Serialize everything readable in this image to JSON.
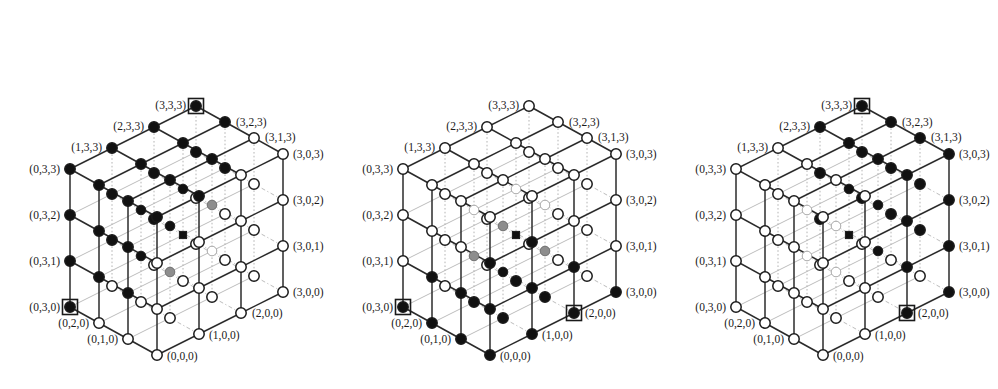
{
  "figure": {
    "kind": "three 4x4x4 cubic lattice diagrams",
    "panel_count": 3,
    "grid_size": 4,
    "axis_values": [
      0,
      1,
      2,
      3
    ]
  },
  "legend": {
    "filled_node": "black filled circle",
    "empty_node": "white open circle",
    "shaded_node": "gray filled circle",
    "boxed_node": "node enclosed in a square frame",
    "square_node": "small black filled square"
  },
  "colors": {
    "node_fill_black": "#111111",
    "node_fill_gray": "#8a8a8a",
    "node_fill_white": "#ffffff",
    "node_stroke": "#1a1a1a",
    "edge_front": "#2b2b2b",
    "edge_back": "#bdbdbd",
    "edge_dotted": "#b4b4b4",
    "label_text": "#1a1a1a",
    "background": "#ffffff"
  },
  "geometry": {
    "origin": [
      157,
      355
    ],
    "step_x": [
      42,
      -21
    ],
    "step_y": [
      -29,
      -16
    ],
    "step_z": [
      0,
      -46
    ],
    "panel_offsets": [
      0,
      333,
      666
    ],
    "node_radius": 5.2,
    "box_size": 15
  },
  "labels": {
    "left_face": [
      "(0,3,3)",
      "(0,3,2)",
      "(0,3,1)",
      "(0,3,0)"
    ],
    "right_face": [
      "(3,0,3)",
      "(3,0,2)",
      "(3,0,1)",
      "(3,0,0)"
    ],
    "top_left_ridge": [
      "(3,3,3)",
      "(2,3,3)",
      "(1,3,3)",
      "(0,3,3)"
    ],
    "top_right_ridge": [
      "(3,3,3)",
      "(3,2,3)",
      "(3,1,3)",
      "(3,0,3)"
    ],
    "bottom_left_ridge": [
      "(0,3,0)",
      "(0,2,0)",
      "(0,1,0)",
      "(0,0,0)"
    ],
    "bottom_right_ridge": [
      "(0,0,0)",
      "(1,0,0)",
      "(2,0,0)",
      "(3,0,0)"
    ],
    "all": [
      "(3,3,3)",
      "(2,3,3)",
      "(1,3,3)",
      "(0,3,3)",
      "(3,2,3)",
      "(3,1,3)",
      "(3,0,3)",
      "(3,0,2)",
      "(3,0,1)",
      "(3,0,0)",
      "(2,0,0)",
      "(1,0,0)",
      "(0,0,0)",
      "(0,1,0)",
      "(0,2,0)",
      "(0,3,0)",
      "(0,3,1)",
      "(0,3,2)"
    ]
  },
  "panels": [
    {
      "name": "panel-left",
      "boxed_nodes": [
        [
          3,
          3,
          3
        ],
        [
          0,
          3,
          0
        ]
      ],
      "square_nodes": [
        [
          2,
          2,
          1
        ]
      ],
      "description": "upper-rear region filled black, lower-front region open"
    },
    {
      "name": "panel-middle",
      "boxed_nodes": [
        [
          0,
          3,
          0
        ],
        [
          2,
          0,
          0
        ]
      ],
      "square_nodes": [
        [
          2,
          2,
          1
        ]
      ],
      "description": "lower-front region filled black, upper-rear region open"
    },
    {
      "name": "panel-right",
      "boxed_nodes": [
        [
          3,
          3,
          3
        ],
        [
          2,
          0,
          0
        ]
      ],
      "square_nodes": [
        [
          2,
          2,
          1
        ]
      ],
      "description": "diagonal half-space filled black toward the +x / +z side"
    }
  ],
  "node_states": {
    "panel_left": {
      "black": [
        [
          3,
          3,
          3
        ],
        [
          2,
          3,
          3
        ],
        [
          1,
          3,
          3
        ],
        [
          0,
          3,
          3
        ],
        [
          3,
          2,
          3
        ],
        [
          0,
          3,
          2
        ],
        [
          0,
          3,
          1
        ],
        [
          0,
          3,
          0
        ],
        [
          1,
          3,
          2
        ],
        [
          2,
          3,
          2
        ],
        [
          3,
          3,
          2
        ],
        [
          1,
          3,
          1
        ],
        [
          2,
          3,
          1
        ],
        [
          0,
          2,
          3
        ],
        [
          1,
          2,
          3
        ],
        [
          2,
          2,
          3
        ],
        [
          3,
          2,
          2
        ],
        [
          0,
          2,
          2
        ],
        [
          1,
          2,
          2
        ],
        [
          2,
          2,
          2
        ],
        [
          0,
          2,
          1
        ],
        [
          1,
          2,
          1
        ],
        [
          0,
          1,
          3
        ],
        [
          1,
          1,
          3
        ],
        [
          2,
          1,
          3
        ],
        [
          0,
          1,
          2
        ],
        [
          1,
          1,
          2
        ],
        [
          0,
          0,
          3
        ],
        [
          1,
          0,
          3
        ],
        [
          0,
          1,
          1
        ]
      ],
      "gray": [
        [
          2,
          3,
          2
        ],
        [
          2,
          3,
          1
        ],
        [
          1,
          2,
          2
        ],
        [
          2,
          2,
          2
        ],
        [
          1,
          2,
          1
        ],
        [
          1,
          1,
          2
        ],
        [
          2,
          1,
          2
        ],
        [
          1,
          1,
          1
        ]
      ],
      "white": [
        [
          3,
          1,
          3
        ],
        [
          3,
          0,
          3
        ],
        [
          3,
          0,
          2
        ],
        [
          3,
          0,
          1
        ],
        [
          3,
          0,
          0
        ],
        [
          2,
          0,
          0
        ],
        [
          1,
          0,
          0
        ],
        [
          0,
          0,
          0
        ],
        [
          0,
          1,
          0
        ],
        [
          0,
          2,
          0
        ],
        [
          3,
          3,
          0
        ],
        [
          3,
          2,
          0
        ],
        [
          3,
          1,
          0
        ],
        [
          2,
          3,
          0
        ],
        [
          1,
          3,
          0
        ],
        [
          2,
          2,
          0
        ],
        [
          1,
          2,
          0
        ],
        [
          1,
          1,
          0
        ],
        [
          2,
          1,
          0
        ],
        [
          0,
          0,
          1
        ],
        [
          0,
          0,
          2
        ],
        [
          1,
          0,
          1
        ],
        [
          1,
          0,
          2
        ],
        [
          2,
          0,
          1
        ],
        [
          2,
          0,
          2
        ],
        [
          2,
          0,
          3
        ],
        [
          3,
          1,
          1
        ],
        [
          3,
          1,
          2
        ],
        [
          3,
          2,
          1
        ],
        [
          2,
          1,
          1
        ],
        [
          2,
          2,
          1
        ],
        [
          3,
          3,
          1
        ]
      ]
    },
    "panel_middle": {
      "black": [
        [
          0,
          0,
          0
        ],
        [
          1,
          0,
          0
        ],
        [
          2,
          0,
          0
        ],
        [
          0,
          1,
          0
        ],
        [
          0,
          2,
          0
        ],
        [
          1,
          1,
          0
        ],
        [
          2,
          1,
          0
        ],
        [
          1,
          0,
          1
        ],
        [
          0,
          0,
          1
        ],
        [
          0,
          1,
          1
        ],
        [
          2,
          0,
          1
        ],
        [
          1,
          1,
          1
        ],
        [
          0,
          3,
          0
        ],
        [
          0,
          0,
          2
        ],
        [
          1,
          0,
          2
        ],
        [
          3,
          0,
          0
        ],
        [
          2,
          2,
          0
        ],
        [
          1,
          2,
          0
        ],
        [
          0,
          2,
          1
        ]
      ],
      "gray": [
        [
          1,
          1,
          1
        ],
        [
          1,
          0,
          1
        ],
        [
          1,
          1,
          2
        ],
        [
          2,
          1,
          1
        ],
        [
          1,
          2,
          1
        ]
      ],
      "white": [
        [
          3,
          3,
          3
        ],
        [
          2,
          3,
          3
        ],
        [
          1,
          3,
          3
        ],
        [
          0,
          3,
          3
        ],
        [
          3,
          2,
          3
        ],
        [
          3,
          1,
          3
        ],
        [
          3,
          0,
          3
        ],
        [
          3,
          0,
          2
        ],
        [
          3,
          0,
          1
        ],
        [
          0,
          3,
          2
        ],
        [
          0,
          3,
          1
        ],
        [
          1,
          3,
          2
        ],
        [
          2,
          3,
          2
        ],
        [
          3,
          3,
          2
        ],
        [
          0,
          2,
          3
        ],
        [
          1,
          2,
          3
        ],
        [
          2,
          2,
          3
        ],
        [
          0,
          1,
          3
        ],
        [
          1,
          1,
          3
        ],
        [
          2,
          1,
          3
        ],
        [
          0,
          0,
          3
        ],
        [
          1,
          0,
          3
        ],
        [
          2,
          0,
          3
        ],
        [
          0,
          2,
          2
        ],
        [
          1,
          2,
          2
        ],
        [
          2,
          2,
          2
        ],
        [
          3,
          2,
          2
        ],
        [
          0,
          1,
          2
        ],
        [
          2,
          1,
          2
        ],
        [
          3,
          1,
          2
        ],
        [
          2,
          0,
          2
        ],
        [
          3,
          3,
          1
        ],
        [
          3,
          2,
          1
        ],
        [
          3,
          1,
          1
        ],
        [
          3,
          0,
          1
        ],
        [
          0,
          3,
          1
        ],
        [
          1,
          3,
          1
        ],
        [
          2,
          3,
          1
        ],
        [
          3,
          3,
          0
        ],
        [
          3,
          2,
          0
        ],
        [
          3,
          1,
          0
        ],
        [
          2,
          3,
          0
        ],
        [
          1,
          3,
          0
        ]
      ]
    },
    "panel_right": {
      "black": [
        [
          3,
          3,
          3
        ],
        [
          2,
          3,
          3
        ],
        [
          3,
          2,
          3
        ],
        [
          3,
          1,
          3
        ],
        [
          3,
          0,
          3
        ],
        [
          3,
          0,
          2
        ],
        [
          3,
          0,
          1
        ],
        [
          3,
          0,
          0
        ],
        [
          2,
          3,
          2
        ],
        [
          3,
          3,
          2
        ],
        [
          2,
          2,
          3
        ],
        [
          3,
          2,
          2
        ],
        [
          2,
          2,
          2
        ],
        [
          3,
          1,
          2
        ],
        [
          2,
          1,
          3
        ],
        [
          3,
          2,
          1
        ],
        [
          3,
          1,
          1
        ],
        [
          2,
          0,
          0
        ],
        [
          2,
          1,
          1
        ],
        [
          2,
          2,
          1
        ],
        [
          3,
          3,
          1
        ],
        [
          2,
          0,
          1
        ],
        [
          2,
          1,
          2
        ],
        [
          2,
          0,
          2
        ],
        [
          2,
          3,
          1
        ],
        [
          2,
          0,
          3
        ]
      ],
      "gray": [
        [
          2,
          3,
          2
        ],
        [
          2,
          2,
          2
        ],
        [
          2,
          2,
          3
        ],
        [
          2,
          1,
          2
        ],
        [
          2,
          2,
          1
        ],
        [
          2,
          1,
          1
        ],
        [
          2,
          0,
          1
        ],
        [
          2,
          1,
          3
        ]
      ],
      "white": [
        [
          1,
          3,
          3
        ],
        [
          0,
          3,
          3
        ],
        [
          0,
          3,
          2
        ],
        [
          0,
          3,
          1
        ],
        [
          0,
          3,
          0
        ],
        [
          0,
          2,
          0
        ],
        [
          0,
          1,
          0
        ],
        [
          0,
          0,
          0
        ],
        [
          1,
          0,
          0
        ],
        [
          1,
          3,
          2
        ],
        [
          1,
          3,
          1
        ],
        [
          1,
          3,
          0
        ],
        [
          0,
          2,
          3
        ],
        [
          1,
          2,
          3
        ],
        [
          0,
          1,
          3
        ],
        [
          1,
          1,
          3
        ],
        [
          0,
          0,
          3
        ],
        [
          1,
          0,
          3
        ],
        [
          0,
          2,
          2
        ],
        [
          1,
          2,
          2
        ],
        [
          0,
          1,
          2
        ],
        [
          1,
          1,
          2
        ],
        [
          0,
          0,
          2
        ],
        [
          1,
          0,
          2
        ],
        [
          0,
          2,
          1
        ],
        [
          1,
          2,
          1
        ],
        [
          0,
          1,
          1
        ],
        [
          1,
          1,
          1
        ],
        [
          0,
          0,
          1
        ],
        [
          1,
          0,
          1
        ],
        [
          2,
          3,
          0
        ],
        [
          3,
          3,
          0
        ],
        [
          3,
          2,
          0
        ],
        [
          3,
          1,
          0
        ],
        [
          2,
          2,
          0
        ],
        [
          2,
          1,
          0
        ],
        [
          1,
          2,
          0
        ],
        [
          1,
          1,
          0
        ]
      ]
    }
  }
}
